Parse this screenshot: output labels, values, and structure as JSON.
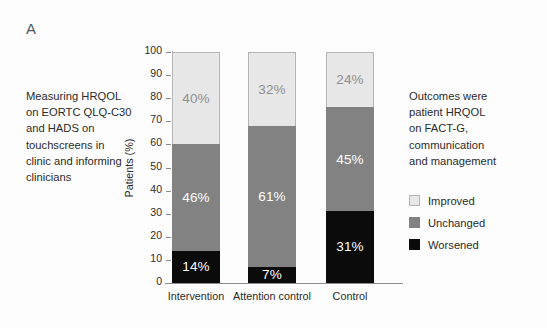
{
  "panel": {
    "label": "A"
  },
  "left_note": {
    "lines": [
      "Measuring HRQOL",
      "on EORTC QLQ-C30",
      "and HADS on",
      "touchscreens in",
      "clinic and informing",
      "clinicians"
    ]
  },
  "right_note": {
    "lines": [
      "Outcomes were",
      "patient HRQOL",
      "on FACT-G,",
      "communication",
      "and management"
    ]
  },
  "legend": {
    "position": "right",
    "items": [
      {
        "label": "Improved",
        "color": "#e7e7e7"
      },
      {
        "label": "Unchanged",
        "color": "#828282"
      },
      {
        "label": "Worsened",
        "color": "#0b0b0b"
      }
    ]
  },
  "chart_data": {
    "type": "bar",
    "stacked": true,
    "title": "",
    "xlabel": "",
    "ylabel": "Patients (%)",
    "ylim": [
      0,
      100
    ],
    "yticks": [
      0,
      10,
      20,
      30,
      40,
      50,
      60,
      70,
      80,
      90,
      100
    ],
    "ytick_labels": [
      "0",
      "10",
      "20",
      "30",
      "40",
      "50",
      "60",
      "70",
      "80",
      "90",
      "100"
    ],
    "grid": false,
    "categories": [
      "Intervention",
      "Attention control",
      "Control"
    ],
    "series": [
      {
        "name": "Worsened",
        "color": "#0b0b0b",
        "values": [
          14,
          7,
          31
        ],
        "labels": [
          "14%",
          "7%",
          "31%"
        ]
      },
      {
        "name": "Unchanged",
        "color": "#828282",
        "values": [
          46,
          61,
          45
        ],
        "labels": [
          "46%",
          "61%",
          "45%"
        ]
      },
      {
        "name": "Improved",
        "color": "#e7e7e7",
        "values": [
          40,
          32,
          24
        ],
        "labels": [
          "40%",
          "32%",
          "24%"
        ]
      }
    ]
  }
}
